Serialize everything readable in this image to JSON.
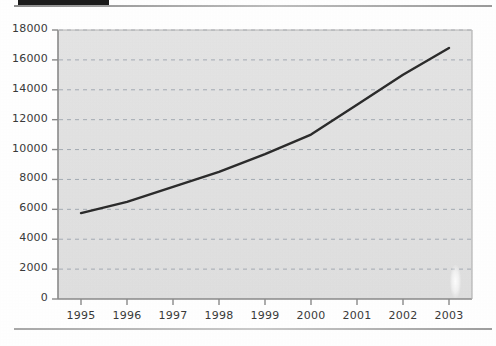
{
  "figure": {
    "top_bar_label": "black-marker-bar",
    "background_color": "#ffffff",
    "plot_background_color": "#e2e2e2",
    "line_color": "#2b2b2b",
    "grid_color": "#9aa3ad",
    "axis_color": "#8a8a8a",
    "tick_text_color": "#3a3a3a"
  },
  "chart_data": {
    "type": "line",
    "title": "",
    "subtitle": "",
    "xlabel": "",
    "ylabel": "",
    "x": [
      1995,
      1996,
      1997,
      1998,
      1999,
      2000,
      2001,
      2002,
      2003
    ],
    "categories": [
      "1995",
      "1996",
      "1997",
      "1998",
      "1999",
      "2000",
      "2001",
      "2002",
      "2003"
    ],
    "series": [
      {
        "name": "series-1",
        "values": [
          5750,
          6500,
          7500,
          8500,
          9700,
          11000,
          13000,
          15000,
          16800
        ]
      }
    ],
    "values": [
      5750,
      6500,
      7500,
      8500,
      9700,
      11000,
      13000,
      15000,
      16800
    ],
    "xlim": [
      1994.5,
      2003.5
    ],
    "ylim": [
      0,
      18000
    ],
    "ytick_labels": [
      "0",
      "2000",
      "4000",
      "6000",
      "8000",
      "10000",
      "12000",
      "14000",
      "16000",
      "18000"
    ],
    "ytick_values": [
      0,
      2000,
      4000,
      6000,
      8000,
      10000,
      12000,
      14000,
      16000,
      18000
    ],
    "xtick_labels": [
      "1995",
      "1996",
      "1997",
      "1998",
      "1999",
      "2000",
      "2001",
      "2002",
      "2003"
    ],
    "grid": "horizontal-dashed",
    "legend": "none",
    "legend_position": "none",
    "annotations": []
  }
}
